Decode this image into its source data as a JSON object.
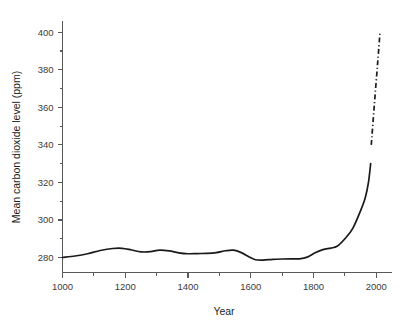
{
  "chart_data": {
    "type": "line",
    "title": "",
    "xlabel": "Year",
    "ylabel": "Mean carbon dioxide level (ppm)",
    "xlim": [
      1000,
      2050
    ],
    "ylim": [
      272,
      406
    ],
    "grid": false,
    "legend": "none",
    "x_ticks_major": [
      1000,
      1200,
      1400,
      1600,
      1800,
      2000
    ],
    "x_tick_labels": [
      "1000",
      "1200",
      "1400",
      "1600",
      "1800",
      "2000"
    ],
    "x_ticks_minor": [
      1100,
      1300,
      1500,
      1700,
      1900
    ],
    "y_ticks_major": [
      280,
      300,
      320,
      340,
      360,
      380,
      400
    ],
    "y_tick_labels": [
      "280",
      "300",
      "320",
      "340",
      "360",
      "380",
      "400"
    ],
    "y_ticks_minor": [
      290,
      310,
      330,
      350,
      370,
      390
    ],
    "series": [
      {
        "name": "historical-co2",
        "style": "solid",
        "color": "#1a1a1a",
        "points": [
          [
            1000,
            280.0
          ],
          [
            1040,
            280.8
          ],
          [
            1080,
            282.0
          ],
          [
            1120,
            283.7
          ],
          [
            1160,
            284.8
          ],
          [
            1190,
            284.9
          ],
          [
            1220,
            284.0
          ],
          [
            1250,
            283.0
          ],
          [
            1280,
            283.1
          ],
          [
            1310,
            283.9
          ],
          [
            1340,
            283.5
          ],
          [
            1370,
            282.5
          ],
          [
            1400,
            282.0
          ],
          [
            1430,
            282.1
          ],
          [
            1460,
            282.2
          ],
          [
            1490,
            282.6
          ],
          [
            1520,
            283.6
          ],
          [
            1545,
            283.9
          ],
          [
            1570,
            282.6
          ],
          [
            1595,
            280.3
          ],
          [
            1615,
            278.8
          ],
          [
            1640,
            278.6
          ],
          [
            1670,
            279.0
          ],
          [
            1700,
            279.2
          ],
          [
            1730,
            279.3
          ],
          [
            1755,
            279.3
          ],
          [
            1780,
            280.2
          ],
          [
            1805,
            282.5
          ],
          [
            1830,
            284.2
          ],
          [
            1855,
            285.0
          ],
          [
            1875,
            286.0
          ],
          [
            1900,
            290.0
          ],
          [
            1925,
            295.5
          ],
          [
            1950,
            305.0
          ],
          [
            1965,
            312.0
          ],
          [
            1975,
            320.0
          ],
          [
            1982,
            330.0
          ]
        ]
      },
      {
        "name": "recent-projected-co2",
        "style": "dash-dot",
        "color": "#1a1a1a",
        "points": [
          [
            1984,
            340.0
          ],
          [
            1994,
            362.0
          ],
          [
            2004,
            383.0
          ],
          [
            2012,
            400.5
          ]
        ]
      }
    ],
    "annotations": []
  }
}
